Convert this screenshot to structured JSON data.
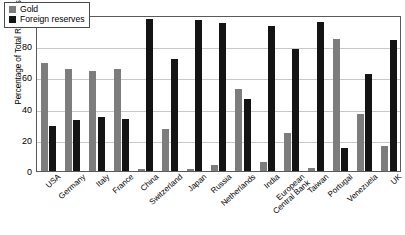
{
  "chart_data": {
    "type": "bar",
    "title": "",
    "subtitle": "",
    "xlabel": "",
    "ylabel": "Percentage of Total Reserves",
    "ylim": [
      0,
      100
    ],
    "yticks": [
      0,
      20,
      40,
      60,
      80,
      100
    ],
    "grid": true,
    "legend_position": "top-left",
    "categories": [
      "USA",
      "Germany",
      "Italy",
      "France",
      "China",
      "Switzerland",
      "Japan",
      "Russia",
      "Netherlands",
      "India",
      "European\nCentral Bank",
      "Taiwan",
      "Portugal",
      "Venezuela",
      "UK"
    ],
    "series": [
      {
        "name": "Gold",
        "color": "#7d7d7d",
        "values": [
          70,
          66,
          65,
          66,
          1,
          27,
          1,
          4,
          53,
          6,
          25,
          2,
          86,
          37,
          16
        ]
      },
      {
        "name": "Foreign reserves",
        "color": "#141414",
        "values": [
          29,
          33,
          35,
          34,
          99,
          73,
          98,
          96,
          47,
          94,
          79,
          97,
          15,
          63,
          85
        ]
      }
    ]
  }
}
